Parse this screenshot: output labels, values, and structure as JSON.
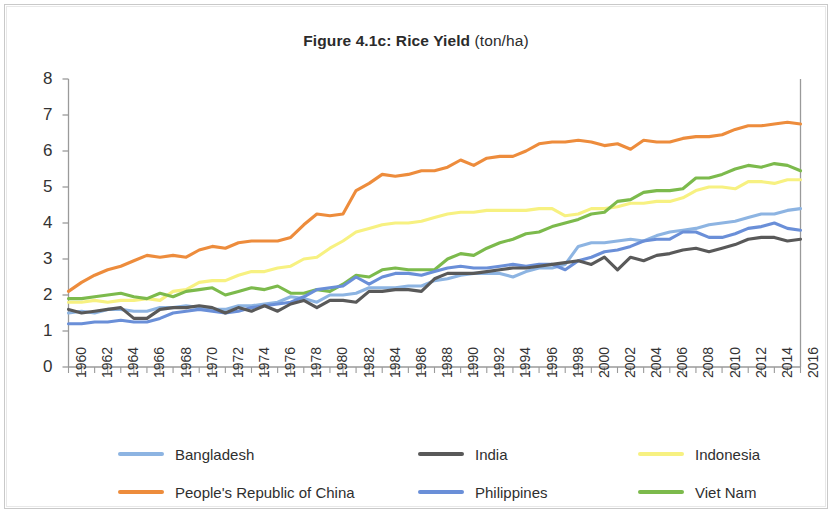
{
  "title": {
    "bold": "Figure 4.1c: Rice Yield",
    "regular": " (ton/ha)"
  },
  "legend": {
    "items": [
      {
        "label": "Bangladesh",
        "color": "#8db4e2",
        "col": 0,
        "row": 0
      },
      {
        "label": "India",
        "color": "#595959",
        "col": 1,
        "row": 0
      },
      {
        "label": "Indonesia",
        "color": "#f7f181",
        "col": 2,
        "row": 0
      },
      {
        "label": "People's Republic of China",
        "color": "#ed8c3c",
        "col": 0,
        "row": 1
      },
      {
        "label": "Philippines",
        "color": "#6a8fd8",
        "col": 1,
        "row": 1
      },
      {
        "label": "Viet Nam",
        "color": "#7cba4c",
        "col": 2,
        "row": 1
      }
    ]
  },
  "chart_data": {
    "type": "line",
    "title": "Figure 4.1c: Rice Yield (ton/ha)",
    "xlabel": "",
    "ylabel": "",
    "ylim": [
      0,
      8
    ],
    "xlim": [
      1960,
      2016
    ],
    "yticks": [
      0,
      1,
      2,
      3,
      4,
      5,
      6,
      7,
      8
    ],
    "ytick_labels": [
      "0",
      "1",
      "2",
      "3",
      "4",
      "5",
      "6",
      "7",
      "8"
    ],
    "xticks": [
      1960,
      1962,
      1964,
      1966,
      1968,
      1970,
      1972,
      1974,
      1976,
      1978,
      1980,
      1982,
      1984,
      1986,
      1988,
      1990,
      1992,
      1994,
      1996,
      1998,
      2000,
      2002,
      2004,
      2006,
      2008,
      2010,
      2012,
      2014,
      2016
    ],
    "xtick_labels": [
      "1960",
      "1962",
      "1964",
      "1966",
      "1968",
      "1970",
      "1972",
      "1974",
      "1976",
      "1978",
      "1980",
      "1982",
      "1984",
      "1986",
      "1988",
      "1990",
      "1992",
      "1994",
      "1996",
      "1998",
      "2000",
      "2002",
      "2004",
      "2006",
      "2008",
      "2010",
      "2012",
      "2014",
      "2016"
    ],
    "xtick_rotation": -90,
    "minor_xticks_every": 1,
    "grid": false,
    "legend_position": "bottom",
    "x": [
      1960,
      1961,
      1962,
      1963,
      1964,
      1965,
      1966,
      1967,
      1968,
      1969,
      1970,
      1971,
      1972,
      1973,
      1974,
      1975,
      1976,
      1977,
      1978,
      1979,
      1980,
      1981,
      1982,
      1983,
      1984,
      1985,
      1986,
      1987,
      1988,
      1989,
      1990,
      1991,
      1992,
      1993,
      1994,
      1995,
      1996,
      1997,
      1998,
      1999,
      2000,
      2001,
      2002,
      2003,
      2004,
      2005,
      2006,
      2007,
      2008,
      2009,
      2010,
      2011,
      2012,
      2013,
      2014,
      2015,
      2016
    ],
    "series": [
      {
        "name": "People's Republic of China",
        "color": "#ed8c3c",
        "values": [
          2.1,
          2.35,
          2.55,
          2.7,
          2.8,
          2.95,
          3.1,
          3.05,
          3.1,
          3.05,
          3.25,
          3.35,
          3.3,
          3.45,
          3.5,
          3.5,
          3.5,
          3.6,
          3.95,
          4.25,
          4.2,
          4.25,
          4.9,
          5.1,
          5.35,
          5.3,
          5.35,
          5.45,
          5.45,
          5.55,
          5.75,
          5.6,
          5.8,
          5.85,
          5.85,
          6.0,
          6.2,
          6.25,
          6.25,
          6.3,
          6.25,
          6.15,
          6.2,
          6.05,
          6.3,
          6.25,
          6.25,
          6.35,
          6.4,
          6.4,
          6.45,
          6.6,
          6.7,
          6.7,
          6.75,
          6.8,
          6.75
        ]
      },
      {
        "name": "Viet Nam",
        "color": "#7cba4c",
        "values": [
          1.9,
          1.9,
          1.95,
          2.0,
          2.05,
          1.95,
          1.9,
          2.05,
          1.95,
          2.1,
          2.15,
          2.2,
          2.0,
          2.1,
          2.2,
          2.15,
          2.25,
          2.05,
          2.05,
          2.15,
          2.1,
          2.3,
          2.55,
          2.5,
          2.7,
          2.75,
          2.7,
          2.7,
          2.7,
          3.0,
          3.15,
          3.1,
          3.3,
          3.45,
          3.55,
          3.7,
          3.75,
          3.9,
          4.0,
          4.1,
          4.25,
          4.3,
          4.6,
          4.65,
          4.85,
          4.9,
          4.9,
          4.95,
          5.25,
          5.25,
          5.35,
          5.5,
          5.6,
          5.55,
          5.65,
          5.6,
          5.45
        ]
      },
      {
        "name": "Indonesia",
        "color": "#f7f181",
        "values": [
          1.8,
          1.8,
          1.85,
          1.8,
          1.85,
          1.85,
          1.9,
          1.85,
          2.1,
          2.15,
          2.35,
          2.4,
          2.4,
          2.55,
          2.65,
          2.65,
          2.75,
          2.8,
          3.0,
          3.05,
          3.3,
          3.5,
          3.75,
          3.85,
          3.95,
          4.0,
          4.0,
          4.05,
          4.15,
          4.25,
          4.3,
          4.3,
          4.35,
          4.35,
          4.35,
          4.35,
          4.4,
          4.4,
          4.2,
          4.25,
          4.4,
          4.4,
          4.45,
          4.55,
          4.55,
          4.6,
          4.6,
          4.7,
          4.9,
          5.0,
          5.0,
          4.95,
          5.15,
          5.15,
          5.1,
          5.2,
          5.2
        ]
      },
      {
        "name": "Bangladesh",
        "color": "#8db4e2",
        "values": [
          1.5,
          1.55,
          1.5,
          1.6,
          1.6,
          1.55,
          1.55,
          1.65,
          1.65,
          1.7,
          1.65,
          1.6,
          1.6,
          1.7,
          1.7,
          1.75,
          1.8,
          1.95,
          1.9,
          1.8,
          2.0,
          2.0,
          2.05,
          2.2,
          2.2,
          2.2,
          2.25,
          2.25,
          2.4,
          2.45,
          2.55,
          2.6,
          2.6,
          2.6,
          2.5,
          2.65,
          2.75,
          2.75,
          2.85,
          3.35,
          3.45,
          3.45,
          3.5,
          3.55,
          3.5,
          3.65,
          3.75,
          3.8,
          3.85,
          3.95,
          4.0,
          4.05,
          4.15,
          4.25,
          4.25,
          4.35,
          4.4
        ]
      },
      {
        "name": "India",
        "color": "#595959",
        "values": [
          1.6,
          1.5,
          1.55,
          1.6,
          1.65,
          1.35,
          1.35,
          1.6,
          1.65,
          1.65,
          1.7,
          1.65,
          1.5,
          1.65,
          1.55,
          1.7,
          1.55,
          1.75,
          1.85,
          1.65,
          1.85,
          1.85,
          1.8,
          2.1,
          2.1,
          2.15,
          2.15,
          2.1,
          2.45,
          2.6,
          2.6,
          2.6,
          2.65,
          2.7,
          2.75,
          2.75,
          2.8,
          2.85,
          2.9,
          2.95,
          2.85,
          3.05,
          2.7,
          3.05,
          2.95,
          3.1,
          3.15,
          3.25,
          3.3,
          3.2,
          3.3,
          3.4,
          3.55,
          3.6,
          3.6,
          3.5,
          3.55
        ]
      },
      {
        "name": "Philippines",
        "color": "#6a8fd8",
        "values": [
          1.2,
          1.2,
          1.25,
          1.25,
          1.3,
          1.25,
          1.25,
          1.35,
          1.5,
          1.55,
          1.6,
          1.55,
          1.5,
          1.55,
          1.65,
          1.7,
          1.75,
          1.8,
          1.95,
          2.15,
          2.2,
          2.25,
          2.5,
          2.3,
          2.5,
          2.6,
          2.6,
          2.55,
          2.65,
          2.75,
          2.8,
          2.75,
          2.75,
          2.8,
          2.85,
          2.8,
          2.85,
          2.85,
          2.7,
          2.95,
          3.05,
          3.2,
          3.25,
          3.35,
          3.5,
          3.55,
          3.55,
          3.75,
          3.75,
          3.6,
          3.6,
          3.7,
          3.85,
          3.9,
          4.0,
          3.85,
          3.8
        ]
      }
    ]
  }
}
